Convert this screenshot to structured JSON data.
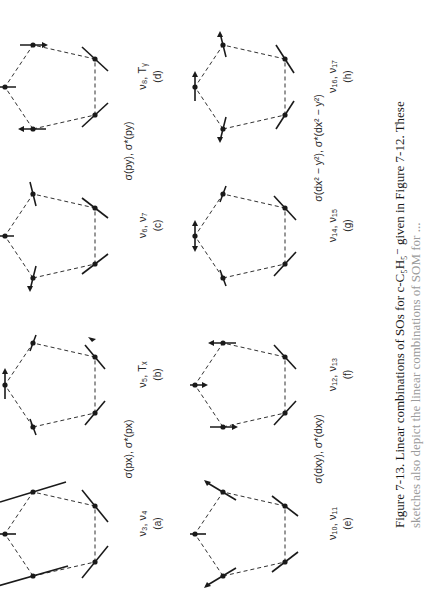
{
  "figure": {
    "number": "Figure 7-13.",
    "caption_line1": "Figure 7-13.  Linear combinations of SOs for c-C₅H₅⁻  given in Figure 7-12. These",
    "caption_line2": "sketches also depict the linear combinations of SOM for ...",
    "molecule": "c-C5H5-",
    "orientation": "rotated 90 degrees counterclockwise"
  },
  "pair_labels": {
    "ab": "σ(px), σ*(px)",
    "cd": "σ(py), σ*(py)",
    "ef": "σ(dxy), σ*(dxy)",
    "gh": "σ(dx² − y²), σ*(dx² − y²)"
  },
  "panels": [
    {
      "letter": "(a)",
      "label": "ν3, ν4",
      "label_text": "ν₃, ν₄"
    },
    {
      "letter": "(b)",
      "label": "ν5, Tx",
      "label_text": "ν₅, Tₓ"
    },
    {
      "letter": "(c)",
      "label": "ν6, ν7",
      "label_text": "ν₆, ν₇"
    },
    {
      "letter": "(d)",
      "label": "ν8, Ty",
      "label_text": "ν₈, Tᵧ"
    },
    {
      "letter": "(e)",
      "label": "ν10, ν11",
      "label_text": "ν₁₀, ν₁₁"
    },
    {
      "letter": "(f)",
      "label": "ν12, ν13",
      "label_text": "ν₁₂, ν₁₃"
    },
    {
      "letter": "(g)",
      "label": "ν14, ν15",
      "label_text": "ν₁₄, ν₁₅"
    },
    {
      "letter": "(h)",
      "label": "ν16, ν17",
      "label_text": "ν₁₆, ν₁₇"
    }
  ],
  "colors": {
    "ink": "#1a1a1a",
    "background": "#ffffff"
  }
}
